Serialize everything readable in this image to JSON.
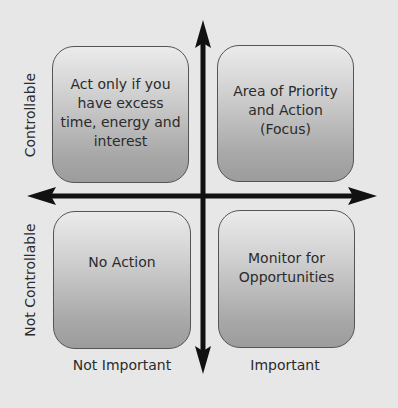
{
  "diagram": {
    "type": "2x2 matrix",
    "axes": {
      "y_top_label": "Controllable",
      "y_bottom_label": "Not Controllable",
      "x_left_label": "Not Important",
      "x_right_label": "Important"
    },
    "quadrants": {
      "top_left": "Act only if you have excess time, energy and interest",
      "top_right": "Area of Priority and Action (Focus)",
      "bottom_left": "No Action",
      "bottom_right": "Monitor for Opportunities"
    },
    "colors": {
      "background": "#e7e7e7",
      "axis": "#111111",
      "box_border": "#555555",
      "box_gradient_top": "#ebebeb",
      "box_gradient_bottom": "#9c9c9c"
    }
  }
}
